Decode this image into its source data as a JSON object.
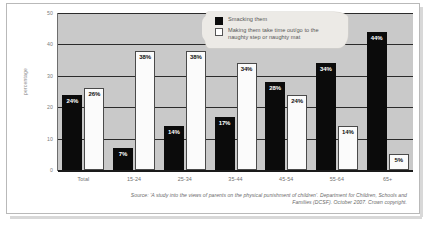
{
  "chart_data": {
    "type": "bar",
    "title": "",
    "xlabel": "",
    "ylabel": "percentage",
    "ylim": [
      0,
      50
    ],
    "yticks": [
      0,
      10,
      20,
      30,
      40,
      50
    ],
    "grid": true,
    "legend_position": "top-right",
    "categories": [
      "Total",
      "15-24",
      "25-34",
      "35-44",
      "45-54",
      "55-64",
      "65+"
    ],
    "series": [
      {
        "name": "Smacking them",
        "color": "#0b0b0b",
        "values": [
          24,
          7,
          14,
          17,
          28,
          34,
          44
        ],
        "labels": [
          "24%",
          "7%",
          "14%",
          "17%",
          "28%",
          "34%",
          "44%"
        ]
      },
      {
        "name": "Making them take time out/go to the naughty step or naughty mat",
        "color": "#ffffff",
        "values": [
          26,
          38,
          38,
          34,
          24,
          14,
          5
        ],
        "labels": [
          "26%",
          "38%",
          "38%",
          "34%",
          "24%",
          "14%",
          "5%"
        ]
      }
    ],
    "source_line1": "Source: 'A study into the views of parents on the physical punishment of children'. Department",
    "source_line2": "for Children, Schools and Families (DCSF). October 2007. Crown copyright."
  },
  "colors": {
    "plot_background": "#c9c9c9",
    "gridline": "#2b2b2b",
    "axis": "#1a1a1a",
    "tick_text": "#7d7d7d",
    "legend_background": "#eceae6"
  }
}
